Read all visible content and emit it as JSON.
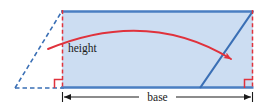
{
  "figure": {
    "type": "geometry-diagram",
    "labels": {
      "height": "height",
      "base": "base"
    },
    "colors": {
      "shape_fill": "#ccddf2",
      "shape_stroke": "#4a7ec2",
      "dashed_outline": "#3a6fb5",
      "annotation_red": "#e0323c",
      "dimension_line": "#1a1a1a",
      "background": "#ffffff",
      "text": "#1a1a1a"
    },
    "geometry": {
      "canvas": [
        265,
        112
      ],
      "parallelogram_solid": {
        "top_left": [
          62,
          11
        ],
        "top_right": [
          253,
          11
        ],
        "bottom_right": [
          253,
          88
        ],
        "bottom_left": [
          62,
          88
        ]
      },
      "dashed_triangle": {
        "apex_top": [
          62,
          11
        ],
        "base_left": [
          15,
          88
        ],
        "base_right": [
          62,
          88
        ]
      },
      "slant_edge_solid": {
        "bottom": [
          200,
          88
        ],
        "top": [
          253,
          11
        ]
      },
      "height_line_left_x": 62,
      "height_line_right_x": 253,
      "dimension_line_y": 97,
      "right_angle_marker_size": 8,
      "curved_arrow": {
        "start": [
          48,
          49
        ],
        "control": [
          148,
          8
        ],
        "end": [
          233,
          61
        ]
      }
    }
  }
}
